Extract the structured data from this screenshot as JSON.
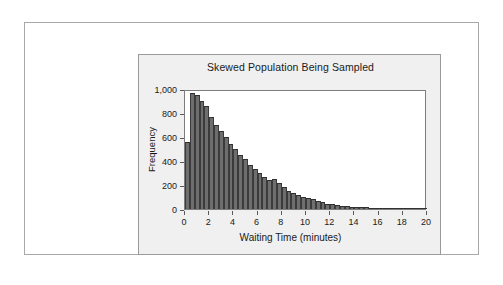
{
  "chart_data": {
    "type": "bar",
    "title": "Skewed Population Being Sampled",
    "xlabel": "Waiting Time (minutes)",
    "ylabel": "Frequency",
    "xlim": [
      0,
      20
    ],
    "ylim": [
      0,
      1000
    ],
    "grid": false,
    "legend": null,
    "bin_width": 0.4,
    "xticks": [
      0,
      2,
      4,
      6,
      8,
      10,
      12,
      14,
      16,
      18,
      20
    ],
    "xtick_labels": [
      "0",
      "2",
      "4",
      "6",
      "8",
      "10",
      "12",
      "14",
      "16",
      "18",
      "20"
    ],
    "yticks": [
      0,
      200,
      400,
      600,
      800,
      1000
    ],
    "ytick_labels": [
      "0",
      "200",
      "400",
      "600",
      "800",
      "1,000"
    ],
    "bar_color": "#6e6e6e",
    "bar_edge_color": "#3b3b3b",
    "x": [
      0.2,
      0.6,
      1.0,
      1.4,
      1.8,
      2.2,
      2.6,
      3.0,
      3.4,
      3.8,
      4.2,
      4.6,
      5.0,
      5.4,
      5.8,
      6.2,
      6.6,
      7.0,
      7.4,
      7.8,
      8.2,
      8.6,
      9.0,
      9.4,
      9.8,
      10.2,
      10.6,
      11.0,
      11.4,
      11.8,
      12.2,
      12.6,
      13.0,
      13.4,
      13.8,
      14.2,
      14.6,
      15.0,
      15.4,
      15.8,
      16.2,
      16.6,
      17.0,
      17.4,
      17.8,
      18.2,
      18.6,
      19.0,
      19.4,
      19.8
    ],
    "values": [
      560,
      968,
      952,
      900,
      855,
      770,
      700,
      650,
      600,
      545,
      500,
      450,
      415,
      370,
      330,
      300,
      265,
      240,
      250,
      215,
      180,
      150,
      130,
      120,
      100,
      95,
      80,
      70,
      60,
      45,
      38,
      32,
      28,
      24,
      20,
      18,
      15,
      13,
      11,
      10,
      9,
      8,
      7,
      6,
      6,
      5,
      5,
      4,
      4,
      3
    ]
  }
}
